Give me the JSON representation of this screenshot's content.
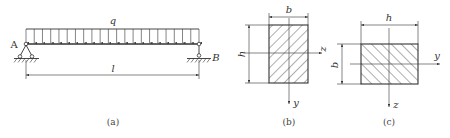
{
  "figure_a": {
    "load_label": "q",
    "support_left_label": "A",
    "support_right_label": "B",
    "span_label": "l",
    "caption": "(a)",
    "arrow_count": 22
  },
  "figure_b": {
    "width_label": "b",
    "height_label": "h",
    "horizontal_axis_label": "z",
    "vertical_axis_label": "y",
    "caption": "(b)"
  },
  "figure_c": {
    "width_label": "h",
    "height_label": "b",
    "horizontal_axis_label": "y",
    "vertical_axis_label": "z",
    "caption": "(c)"
  },
  "colors": {
    "line": "#333333",
    "background": "#ffffff"
  }
}
